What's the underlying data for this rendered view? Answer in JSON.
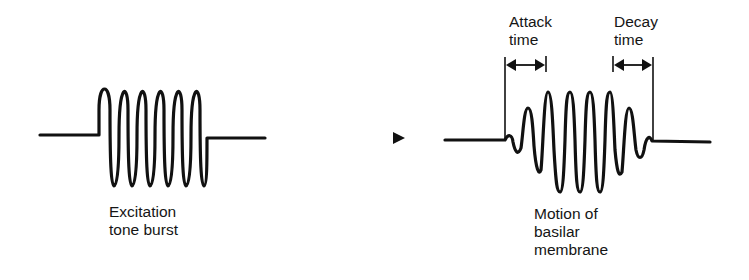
{
  "left_panel": {
    "caption_line1": "Excitation",
    "caption_line2": "tone burst"
  },
  "right_panel": {
    "attack_line1": "Attack",
    "attack_line2": "time",
    "decay_line1": "Decay",
    "decay_line2": "time",
    "caption_line1": "Motion of",
    "caption_line2": "basilar",
    "caption_line3": "membrane"
  },
  "colors": {
    "ink": "#111111",
    "background": "#ffffff"
  }
}
